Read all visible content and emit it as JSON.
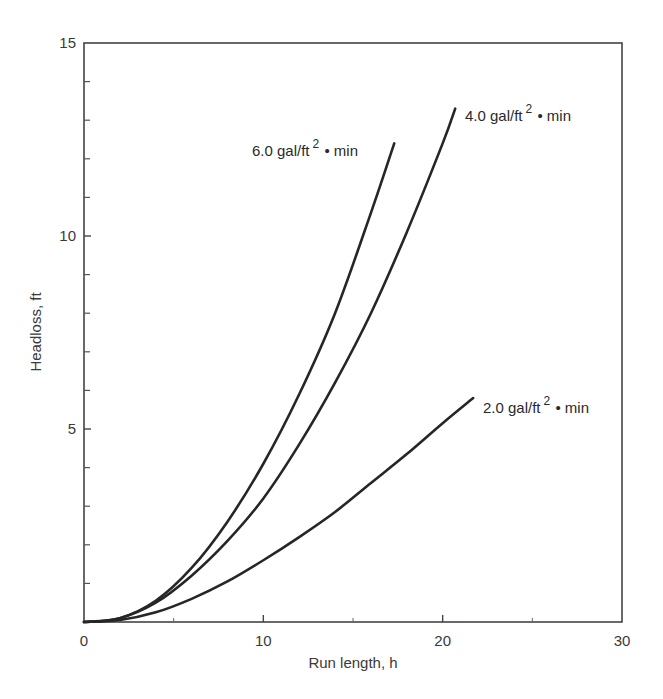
{
  "chart_data": {
    "type": "line",
    "title": "",
    "xlabel": "Run length, h",
    "ylabel": "Headloss, ft",
    "xlim": [
      0,
      30
    ],
    "ylim": [
      0,
      15
    ],
    "x_ticks": [
      "0",
      "10",
      "20",
      "30"
    ],
    "y_ticks": [
      "0",
      "5",
      "10",
      "15"
    ],
    "x_minor_ticks": [
      5,
      15,
      25
    ],
    "y_minor_ticks": [
      1,
      2,
      3,
      4,
      6,
      7,
      8,
      9,
      11,
      12,
      13,
      14
    ],
    "grid": false,
    "legend": "inline labels at curve ends",
    "series": [
      {
        "name": "6.0 gal/ft² • min",
        "label_main": "6.0 gal/ft",
        "label_sup": "2",
        "label_tail": " • min",
        "x": [
          0,
          2,
          4,
          6,
          8,
          10,
          12,
          14,
          16,
          17.3
        ],
        "y": [
          0,
          0.1,
          0.55,
          1.4,
          2.6,
          4.1,
          5.9,
          8.0,
          10.6,
          12.4
        ]
      },
      {
        "name": "4.0 gal/ft² • min",
        "label_main": "4.0 gal/ft",
        "label_sup": "2",
        "label_tail": " • min",
        "x": [
          0,
          2,
          4,
          6,
          8,
          10,
          12,
          14,
          16,
          18,
          20,
          20.7
        ],
        "y": [
          0,
          0.1,
          0.5,
          1.2,
          2.1,
          3.2,
          4.6,
          6.2,
          8.0,
          10.1,
          12.4,
          13.3
        ]
      },
      {
        "name": "2.0 gal/ft² • min",
        "label_main": "2.0 gal/ft",
        "label_sup": "2",
        "label_tail": " • min",
        "x": [
          0,
          2,
          4,
          6,
          8,
          10,
          12,
          14,
          16,
          18,
          20,
          21.7
        ],
        "y": [
          0,
          0.05,
          0.25,
          0.6,
          1.05,
          1.6,
          2.2,
          2.85,
          3.6,
          4.35,
          5.15,
          5.8
        ]
      }
    ]
  }
}
